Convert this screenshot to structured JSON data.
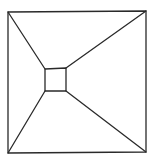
{
  "diagram": {
    "type": "line-drawing",
    "stroke_color": "#2a2a2a",
    "background": "#ffffff",
    "outer_square": {
      "tl": [
        8,
        12
      ],
      "tr": [
        146,
        11
      ],
      "br": [
        146,
        152
      ],
      "bl": [
        8,
        153
      ]
    },
    "inner_square": {
      "tl": [
        45,
        69
      ],
      "tr": [
        66,
        68
      ],
      "br": [
        66,
        91
      ],
      "bl": [
        45,
        91
      ]
    }
  }
}
